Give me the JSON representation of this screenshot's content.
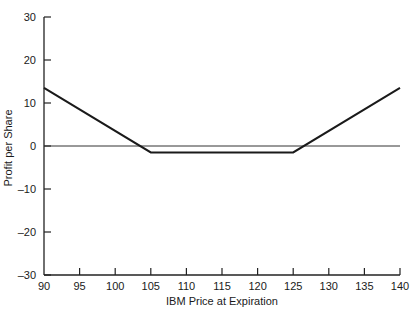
{
  "chart_data": {
    "type": "line",
    "title": "",
    "xlabel": "IBM Price at Expiration",
    "ylabel": "Profit per Share",
    "xlim": [
      90,
      140
    ],
    "ylim": [
      -30,
      30
    ],
    "x_ticks": [
      90,
      95,
      100,
      105,
      110,
      115,
      120,
      125,
      130,
      135,
      140
    ],
    "y_ticks": [
      30,
      20,
      10,
      0,
      -10,
      -20,
      -30
    ],
    "x_tick_labels": [
      "90",
      "95",
      "100",
      "105",
      "110",
      "115",
      "120",
      "125",
      "130",
      "135",
      "140"
    ],
    "y_tick_labels": [
      "30",
      "20",
      "10",
      "0",
      "–10",
      "–20",
      "–30"
    ],
    "grid": false,
    "legend": null,
    "series": [
      {
        "name": "Payoff",
        "x": [
          90,
          105,
          125,
          140
        ],
        "y": [
          13.5,
          -1.5,
          -1.5,
          13.5
        ],
        "color": "#1a1a1a",
        "line_width": 2
      },
      {
        "name": "Zero line",
        "x": [
          90,
          140
        ],
        "y": [
          0,
          0
        ],
        "color": "#333333",
        "line_width": 1
      }
    ]
  },
  "layout": {
    "plot_left": 44,
    "plot_right": 400,
    "plot_top": 17,
    "plot_bottom": 275
  }
}
